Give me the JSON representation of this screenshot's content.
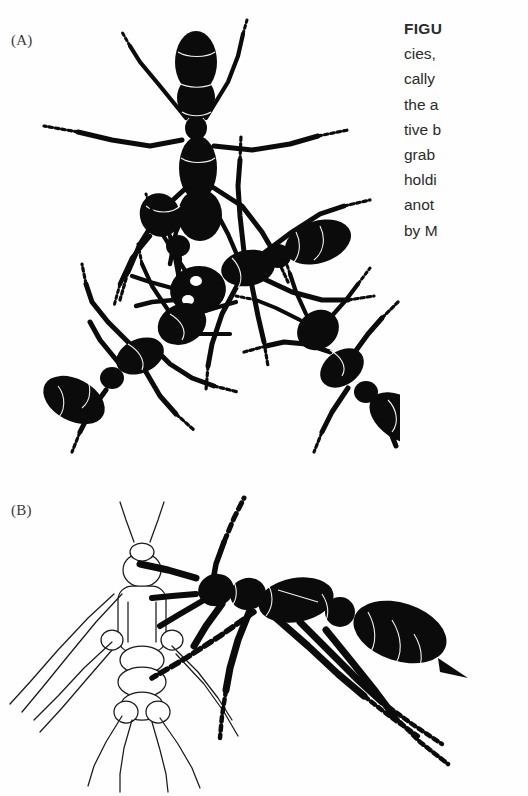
{
  "page": {
    "background_color": "#ffffff",
    "ink_color": "#0b0b0b",
    "text_color": "#2b2b2b"
  },
  "panels": [
    {
      "id": "A",
      "label": "(A)",
      "illustration": "group-of-four-black-silhouette-ants"
    },
    {
      "id": "B",
      "label": "(B)",
      "illustration": "black-ant-grabbing-white-outlined-insect-prey"
    }
  ],
  "caption": {
    "lines": [
      {
        "text": "FIGU",
        "bold": true
      },
      {
        "text": "cies,",
        "bold": false
      },
      {
        "text": "cally",
        "bold": false
      },
      {
        "text": "the a",
        "bold": false
      },
      {
        "text": "tive b",
        "bold": false
      },
      {
        "text": "grab",
        "bold": false
      },
      {
        "text": "holdi",
        "bold": false
      },
      {
        "text": "anot",
        "bold": false
      },
      {
        "text": "by M",
        "bold": false
      }
    ]
  }
}
